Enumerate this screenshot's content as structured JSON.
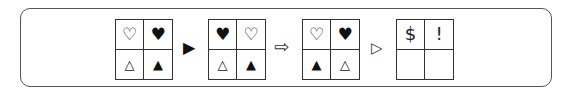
{
  "puzzle": {
    "grids": [
      {
        "cells": [
          "♡",
          "♥",
          "△",
          "▲"
        ]
      },
      {
        "cells": [
          "♥",
          "♡",
          "△",
          "▲"
        ]
      },
      {
        "cells": [
          "♡",
          "♥",
          "▲",
          "△"
        ]
      },
      {
        "cells": [
          "$",
          "!",
          "",
          ""
        ]
      }
    ],
    "arrows": [
      {
        "glyph": "▶",
        "name": "filled-triangle-arrow"
      },
      {
        "glyph": "⇨",
        "name": "hollow-block-arrow"
      },
      {
        "glyph": "▷",
        "name": "hollow-triangle-arrow"
      }
    ]
  }
}
